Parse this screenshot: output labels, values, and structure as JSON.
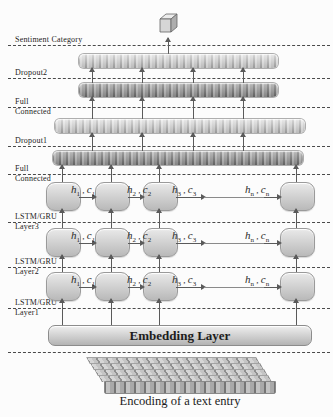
{
  "colors": {
    "bar_light": "#d6d6d6",
    "bar_dark": "#9c9c9c",
    "block_fill": "#cfcfcf",
    "line": "#5a5a5a",
    "background": "#fcfcfc"
  },
  "left_labels": [
    {
      "top": "Sentiment Category",
      "bottom": ""
    },
    {
      "top": "Dropout2",
      "bottom": ""
    },
    {
      "top": "Full",
      "bottom": "Connected"
    },
    {
      "top": "Dropout1",
      "bottom": ""
    },
    {
      "top": "Full",
      "bottom": "Connected"
    },
    {
      "top": "LSTM/GRU",
      "bottom": "Layer3"
    },
    {
      "top": "LSTM/GRU",
      "bottom": "Layer2"
    },
    {
      "top": "LSTM/GRU",
      "bottom": "Layer1"
    }
  ],
  "hc": [
    {
      "h": "h",
      "hsub": "1",
      "sep": " , ",
      "c": "c",
      "csub": "1"
    },
    {
      "h": "h",
      "hsub": "2",
      "sep": " , ",
      "c": "c",
      "csub": "2"
    },
    {
      "h": "h",
      "hsub": "3",
      "sep": " , ",
      "c": "c",
      "csub": "3"
    },
    {
      "h": "h",
      "hsub": "n",
      "sep": " , ",
      "c": "c",
      "csub": "n"
    }
  ],
  "embedding": {
    "label": "Embedding Layer"
  },
  "caption": "Encoding of a text entry"
}
